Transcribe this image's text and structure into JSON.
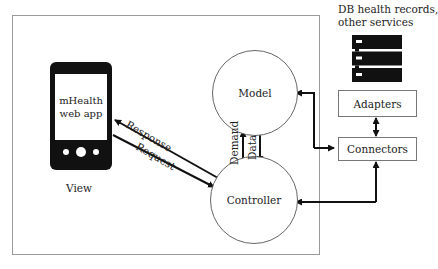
{
  "diagram": {
    "type": "MVC architecture for mHealth web app",
    "view": {
      "device_label": "mHealth web app",
      "device_label_lines": [
        "mHealth",
        "web app"
      ],
      "caption": "View"
    },
    "model": {
      "label": "Model"
    },
    "controller": {
      "label": "Controller"
    },
    "external": {
      "title_lines": [
        "DB health records,",
        "other services"
      ],
      "icon": "server-rack-icon"
    },
    "adapters": {
      "label": "Adapters"
    },
    "connectors": {
      "label": "Connectors"
    },
    "edges": [
      {
        "from": "Controller",
        "to": "View",
        "label": "Response"
      },
      {
        "from": "View",
        "to": "Controller",
        "label": "Request"
      },
      {
        "from": "Controller",
        "to": "Model",
        "label": "Demand"
      },
      {
        "from": "Model",
        "to": "Controller",
        "label": "Data"
      },
      {
        "from": "Connectors",
        "to": "Model",
        "label": "",
        "bidirectional": true
      },
      {
        "from": "Adapters",
        "to": "Connectors",
        "label": "",
        "bidirectional": true
      },
      {
        "from": "Connectors",
        "to": "Controller",
        "label": "",
        "bidirectional": true
      }
    ],
    "edge_labels": {
      "response": "Response",
      "request": "Request",
      "demand": "Demand",
      "data": "Data"
    },
    "colors": {
      "line": "#111111",
      "frame": "#9a9a9a",
      "icon_fill": "#111111",
      "background": "#ffffff"
    }
  }
}
